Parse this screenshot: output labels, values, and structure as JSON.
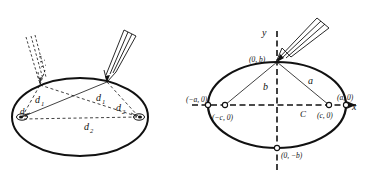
{
  "figure": {
    "background": "#ffffff",
    "ink": "#111111",
    "panels": [
      "left",
      "right"
    ]
  },
  "left_panel": {
    "name": "string-and-tacks ellipse construction",
    "ellipse": {
      "cx": 80,
      "cy": 117,
      "rx": 68,
      "ry": 39
    },
    "tacks": [
      {
        "id": "focus-left",
        "x": 22,
        "y": 117
      },
      {
        "id": "focus-right",
        "x": 139,
        "y": 117
      }
    ],
    "pencil_positions": [
      {
        "id": "pencil-previous",
        "style": "dashed",
        "tip_x": 40,
        "tip_y": 85
      },
      {
        "id": "pencil-current",
        "style": "solid",
        "tip_x": 107,
        "tip_y": 82
      }
    ],
    "labels": [
      {
        "id": "d1-left",
        "text": "d",
        "sub": "1",
        "x": 35,
        "y": 100
      },
      {
        "id": "d2-left",
        "text": "d",
        "sub": "2",
        "x": 27,
        "y": 112
      },
      {
        "id": "d1-right",
        "text": "d",
        "sub": "1",
        "x": 96,
        "y": 99
      },
      {
        "id": "d2-right",
        "text": "d",
        "sub": "2",
        "x": 116,
        "y": 108
      },
      {
        "id": "d2-lower",
        "text": "d",
        "sub": "2",
        "x": 86,
        "y": 127
      }
    ]
  },
  "right_panel": {
    "name": "ellipse in coordinate plane",
    "ellipse": {
      "cx": 277,
      "cy": 105,
      "rx": 69,
      "ry": 43
    },
    "axes": {
      "x_label": "x",
      "y_label": "y"
    },
    "center_label": "C",
    "points": [
      {
        "id": "vertex-left",
        "label": "(−a, 0)",
        "x": 208,
        "y": 105
      },
      {
        "id": "vertex-right",
        "label": "(a, 0)",
        "x": 346,
        "y": 105
      },
      {
        "id": "covertex-top",
        "label": "(0, b)",
        "x": 277,
        "y": 62
      },
      {
        "id": "covertex-bot",
        "label": "(0, −b)",
        "x": 277,
        "y": 148
      },
      {
        "id": "focus-left",
        "label": "(−c, 0)",
        "x": 225,
        "y": 105
      },
      {
        "id": "focus-right",
        "label": "(c, 0)",
        "x": 329,
        "y": 105
      }
    ],
    "segment_labels": [
      {
        "id": "semi-major-a",
        "text": "a",
        "x": 311,
        "y": 80
      },
      {
        "id": "semi-minor-b",
        "text": "b",
        "x": 267,
        "y": 86
      }
    ],
    "pencil": {
      "id": "pencil-at-covertex",
      "tip_x": 277,
      "tip_y": 62
    }
  }
}
